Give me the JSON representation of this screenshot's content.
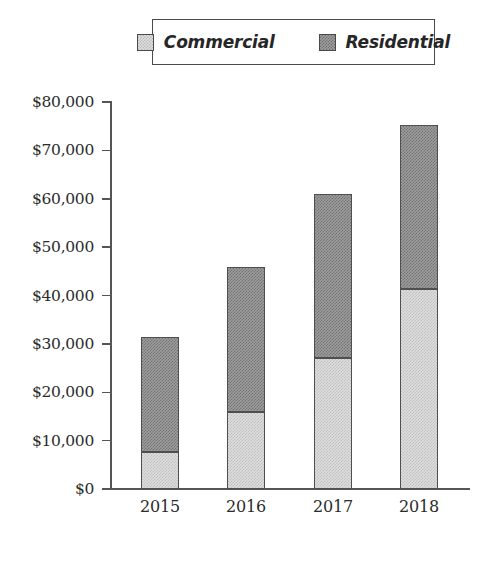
{
  "chart_data": {
    "type": "bar",
    "subtype": "stacked-bar",
    "title": "",
    "xlabel": "",
    "ylabel": "",
    "categories": [
      "2015",
      "2016",
      "2017",
      "2018"
    ],
    "series": [
      {
        "name": "Commercial",
        "color": "#dedede",
        "values": [
          7600,
          15900,
          27100,
          41300
        ]
      },
      {
        "name": "Residential",
        "color": "#9d9d9d",
        "values": [
          23800,
          30000,
          33900,
          34000
        ]
      }
    ],
    "totals": [
      31400,
      45900,
      61000,
      75300
    ],
    "ylim": [
      0,
      80000
    ],
    "ytick_values": [
      0,
      10000,
      20000,
      30000,
      40000,
      50000,
      60000,
      70000,
      80000
    ],
    "ytick_labels": [
      "$0",
      "$10,000",
      "$20,000",
      "$30,000",
      "$40,000",
      "$50,000",
      "$60,000",
      "$70,000",
      "$80,000"
    ],
    "grid": false,
    "legend_position": "top-center",
    "legend_entries": [
      "Commercial",
      "Residential"
    ],
    "currency_prefix": "$"
  },
  "legend": {
    "items": [
      {
        "label": "Commercial",
        "swatch": "commercial-swatch-icon"
      },
      {
        "label": "Residential",
        "swatch": "residential-swatch-icon"
      }
    ]
  },
  "axes": {
    "y_labels": [
      "$80,000",
      "$70,000",
      "$60,000",
      "$50,000",
      "$40,000",
      "$30,000",
      "$20,000",
      "$10,000",
      "$0"
    ],
    "x_labels": [
      "2015",
      "2016",
      "2017",
      "2018"
    ]
  },
  "colors": {
    "commercial": "#dedede",
    "residential": "#9d9d9d",
    "axis": "#555555",
    "outline": "#4f4f4f",
    "text": "#2b2b2b",
    "background": "#ffffff"
  }
}
